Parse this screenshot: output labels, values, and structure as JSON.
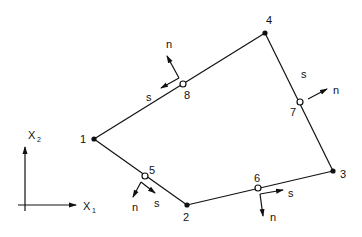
{
  "diagram": {
    "title": "",
    "type": "quadrilateral element with corner and mid-side nodes",
    "axes": {
      "x1_label": "X",
      "x1_sub": "1",
      "x2_label": "X",
      "x2_sub": "2"
    },
    "corner_nodes": [
      {
        "id": "1",
        "label": "1"
      },
      {
        "id": "2",
        "label": "2"
      },
      {
        "id": "3",
        "label": "3"
      },
      {
        "id": "4",
        "label": "4"
      }
    ],
    "midside_nodes": [
      {
        "id": "5",
        "label": "5",
        "n_label": "n",
        "s_label": "s"
      },
      {
        "id": "6",
        "label": "6",
        "n_label": "n",
        "s_label": "s"
      },
      {
        "id": "7",
        "label": "7",
        "n_label": "n",
        "s_label": "s"
      },
      {
        "id": "8",
        "label": "8",
        "n_label": "n",
        "s_label": "s"
      }
    ],
    "edges": [
      "1-5-2",
      "2-6-3",
      "3-7-4",
      "4-8-1"
    ],
    "colors": {
      "ink": "#111111",
      "background": "#ffffff"
    }
  }
}
